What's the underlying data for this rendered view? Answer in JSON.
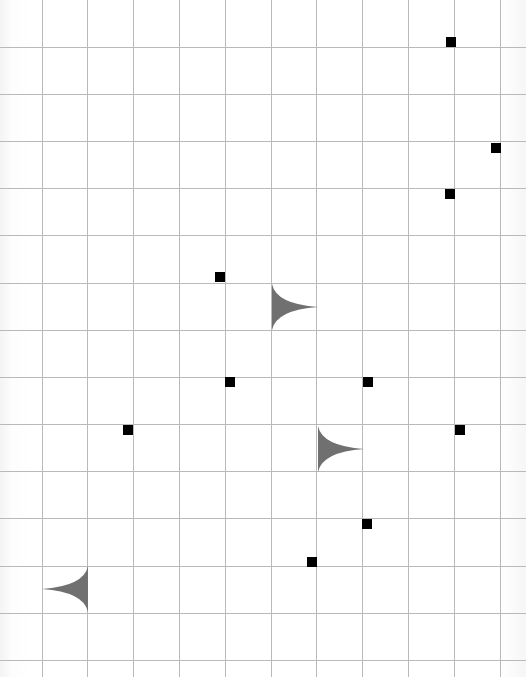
{
  "board": {
    "width": 526,
    "height": 677,
    "background": "#ffffff",
    "grid_color": "#b9b9b9",
    "grid": {
      "vertical_lines_x": [
        42,
        87,
        133,
        179,
        225,
        271,
        316,
        362,
        408,
        454,
        500
      ],
      "horizontal_lines_y": [
        47,
        94,
        141,
        188,
        235,
        283,
        330,
        377,
        424,
        471,
        518,
        566,
        613,
        660
      ]
    }
  },
  "markers": {
    "color": "#000000",
    "size": 10,
    "items": [
      {
        "x": 451,
        "y": 42
      },
      {
        "x": 496,
        "y": 148
      },
      {
        "x": 450,
        "y": 194
      },
      {
        "x": 220,
        "y": 277
      },
      {
        "x": 230,
        "y": 382
      },
      {
        "x": 368,
        "y": 382
      },
      {
        "x": 128,
        "y": 430
      },
      {
        "x": 460,
        "y": 430
      },
      {
        "x": 367,
        "y": 524
      },
      {
        "x": 312,
        "y": 562
      }
    ]
  },
  "cusps": {
    "color": "#707070",
    "items": [
      {
        "left": 272,
        "top": 284,
        "direction": "right"
      },
      {
        "left": 318,
        "top": 426,
        "direction": "right"
      },
      {
        "left": 42,
        "top": 566,
        "direction": "left"
      }
    ]
  }
}
